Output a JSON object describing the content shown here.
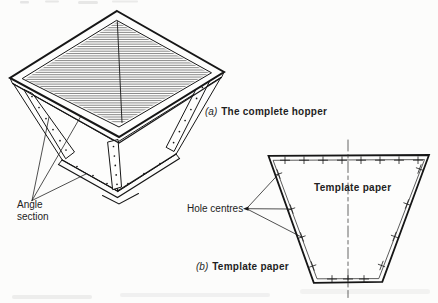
{
  "figure": {
    "captions": {
      "a": {
        "index": "(a)",
        "title": "The complete hopper"
      },
      "b": {
        "index": "(b)",
        "title": "Template paper"
      }
    },
    "labels": {
      "angle_section": "Angle section",
      "hole_centres": "Hole centres",
      "template_paper": "Template paper"
    },
    "colors": {
      "ink": "#1b1b1b",
      "paper": "#fcfcfb"
    },
    "hole_centre_marks": {
      "top": 8,
      "left": 4,
      "right": 4,
      "bottom": 3
    }
  }
}
